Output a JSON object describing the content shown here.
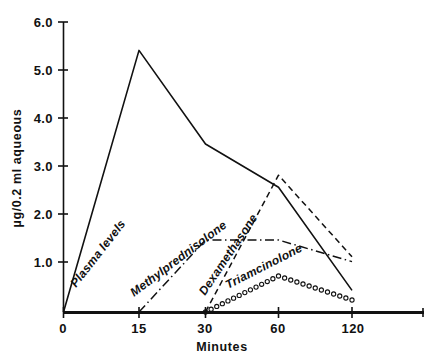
{
  "chart_data": {
    "type": "line",
    "title": "",
    "subtitle": "",
    "xlabel": "Minutes",
    "ylabel": "µg/0.2 ml aqueous",
    "x": [
      0,
      15,
      30,
      60,
      120
    ],
    "xtick_labels": [
      "0",
      "15",
      "30",
      "60",
      "120"
    ],
    "ytick_labels": [
      "1.0",
      "2.0",
      "3.0",
      "4.0",
      "5.0",
      "6.0"
    ],
    "ytick_values": [
      1.0,
      2.0,
      3.0,
      4.0,
      5.0,
      6.0
    ],
    "ylim": [
      0,
      6.0
    ],
    "xlim_labels": [
      "0",
      "120"
    ],
    "x_axis_scale": "categorical",
    "grid": false,
    "legend_position": "inline-labels",
    "annotations": [
      {
        "text": "Plasma levels",
        "series": "Plasma levels"
      },
      {
        "text": "Methylprednisolone",
        "series": "Methylprednisolone"
      },
      {
        "text": "Dexamethasone",
        "series": "Dexamethasone"
      },
      {
        "text": "Triamcinolone",
        "series": "Triamcinolone"
      }
    ],
    "series": [
      {
        "name": "Plasma levels",
        "style": "solid",
        "color": "#111111",
        "x": [
          0,
          15,
          30,
          60,
          120
        ],
        "values": [
          0.0,
          5.45,
          3.5,
          2.6,
          0.45
        ]
      },
      {
        "name": "Methylprednisolone",
        "style": "dash-dot",
        "color": "#111111",
        "x": [
          15,
          30,
          60,
          120
        ],
        "values": [
          0.0,
          1.5,
          1.5,
          1.05
        ]
      },
      {
        "name": "Dexamethasone",
        "style": "dashed",
        "color": "#111111",
        "x": [
          30,
          60,
          120
        ],
        "values": [
          0.0,
          2.85,
          1.15
        ]
      },
      {
        "name": "Triamcinolone",
        "style": "open-circles",
        "color": "#111111",
        "x": [
          30,
          60,
          120
        ],
        "values": [
          0.0,
          0.75,
          0.25
        ]
      }
    ]
  },
  "axes": {
    "y_title": "µg/0.2 ml aqueous",
    "x_title": "Minutes",
    "y_ticks": [
      "6.0",
      "5.0",
      "4.0",
      "3.0",
      "2.0",
      "1.0"
    ],
    "x_ticks": [
      "0",
      "15",
      "30",
      "60",
      "120"
    ]
  },
  "labels": {
    "plasma": "Plasma levels",
    "methylprednisolone": "Methylprednisolone",
    "dexamethasone": "Dexamethasone",
    "triamcinolone": "Triamcinolone"
  }
}
